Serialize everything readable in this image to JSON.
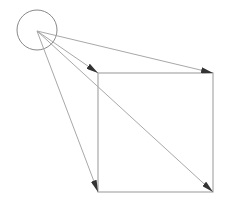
{
  "diagram": {
    "width": 231,
    "height": 209,
    "background": "#ffffff",
    "stroke_color": "#a8a8a8",
    "arrow_color": "#333333",
    "circle": {
      "cx": 37,
      "cy": 30,
      "r": 20
    },
    "origin": {
      "x": 37,
      "y": 31
    },
    "square": {
      "x": 98,
      "y": 73,
      "width": 115,
      "height": 119
    },
    "arrows": [
      {
        "name": "arrow-to-top-left",
        "x2": 98,
        "y2": 73
      },
      {
        "name": "arrow-to-top-right",
        "x2": 213,
        "y2": 73
      },
      {
        "name": "arrow-to-bottom-left",
        "x2": 98,
        "y2": 192
      },
      {
        "name": "arrow-to-bottom-right",
        "x2": 213,
        "y2": 192
      }
    ]
  }
}
